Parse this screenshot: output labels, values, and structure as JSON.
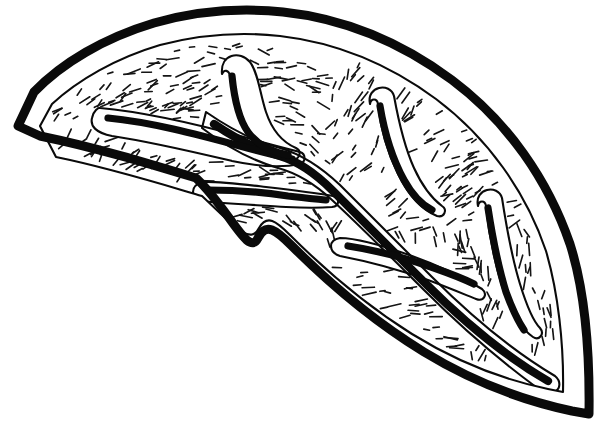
{
  "figure": {
    "title": "Leaf cross-section line drawing",
    "style": "black-and-white ink line art",
    "background_color": "#ffffff",
    "ink_color": "#0a0a0a",
    "canvas": {
      "width": 607,
      "height": 434
    },
    "labels": [],
    "annotations": [],
    "caption": ""
  },
  "outline": {
    "name": "organ-outline",
    "description": "thick crescent leaf-shaped boundary with concave lower-left notch",
    "outer_stroke_width": 9,
    "inner_stroke_width": 2.1,
    "left_tip": [
      18,
      126
    ],
    "top_apex": [
      258,
      11
    ],
    "right_bottom_tip": [
      589,
      414
    ],
    "notch_point": [
      258,
      238
    ],
    "outer_path": "M 18 126 L 34 92 C 62 63 104 38 154 23 C 200 10 245 8 283 12 C 340 18 398 40 452 80 C 508 122 548 180 570 244 C 584 288 590 344 589 414 L 572 411 C 520 400 470 380 424 352 C 372 320 326 280 292 246 C 276 230 266 222 258 238 C 248 258 230 210 196 178 C 150 164 98 148 40 136 Z",
    "inner_path": "M 40 126 L 52 104 C 78 80 116 58 160 45 C 202 34 244 32 280 36 C 332 42 386 62 436 99 C 488 138 526 192 546 251 C 558 292 564 344 563 392 L 548 389 C 500 379 454 360 412 334 C 364 304 322 267 290 235 C 276 221 267 214 259 228 C 250 246 233 225 202 196 C 158 183 110 168 56 157 Z"
  },
  "main_vein": {
    "name": "midrib",
    "description": "primary vein running from upper-left junction down to lower-right tip",
    "core_stroke_width": 8.2,
    "sheath_stroke_width": 2.1,
    "start": [
      214,
      124
    ],
    "end": [
      548,
      381
    ]
  },
  "vein_branches": [
    {
      "name": "branch-left-lateral",
      "position": "upper left, horizontal hook pointing left",
      "tip": [
        106,
        116
      ],
      "junction": [
        290,
        160
      ]
    },
    {
      "name": "branch-upper-middle",
      "position": "upper middle, vertical hook pointing up",
      "tip": [
        232,
        72
      ],
      "junction": [
        288,
        152
      ]
    },
    {
      "name": "branch-lower-left",
      "position": "middle left, hook pointing left-down",
      "tip": [
        205,
        185
      ],
      "junction": [
        320,
        198
      ]
    },
    {
      "name": "branch-upper-right",
      "position": "upper right, hook pointing up",
      "tip": [
        380,
        102
      ],
      "junction": [
        432,
        207
      ]
    },
    {
      "name": "branch-right",
      "position": "right, long hook pointing up",
      "tip": [
        487,
        204
      ],
      "junction": [
        524,
        320
      ]
    },
    {
      "name": "branch-lower-middle",
      "position": "lower middle, hook pointing left",
      "tip": [
        345,
        242
      ],
      "junction": [
        470,
        284
      ]
    }
  ],
  "texture": {
    "name": "parenchyma-hatching",
    "description": "dense field of short dash strokes filling the interior, oriented radially",
    "dash_count": 420,
    "dash_length_range": [
      5,
      14
    ],
    "stroke_width": 1.65,
    "color": "#151515"
  }
}
